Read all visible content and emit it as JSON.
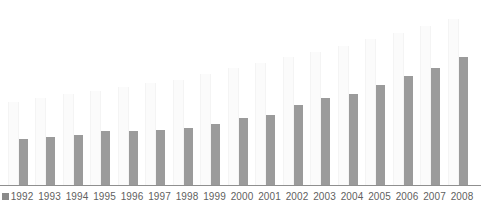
{
  "chart_data": {
    "type": "bar",
    "title": "",
    "subtitle": "",
    "xlabel": "",
    "ylabel": "",
    "grid": false,
    "legend_position": "bottom-left",
    "axis_baseline_visible": true,
    "ylim": [
      0,
      100
    ],
    "categories": [
      "1992",
      "1993",
      "1994",
      "1995",
      "1996",
      "1997",
      "1998",
      "1999",
      "2000",
      "2001",
      "2002",
      "2003",
      "2004",
      "2005",
      "2006",
      "2007",
      "2008"
    ],
    "series": [
      {
        "name": "series-light",
        "color": "#fbfbfb",
        "values": [
          45,
          47,
          49,
          51,
          53,
          55,
          57,
          60,
          63,
          66,
          69,
          72,
          75,
          79,
          82,
          86,
          90
        ]
      },
      {
        "name": "series-dark",
        "color": "#9b9b9b",
        "values": [
          25,
          26,
          27,
          29,
          29,
          30,
          31,
          33,
          36,
          38,
          43,
          47,
          49,
          54,
          59,
          63,
          69
        ]
      }
    ]
  },
  "legend": {
    "marker_name": "legend-swatch",
    "marker_color": "#8a8a8a",
    "label": ""
  },
  "axis": {
    "tick_labels": [
      "1992",
      "1993",
      "1994",
      "1995",
      "1996",
      "1997",
      "1998",
      "1999",
      "2000",
      "2001",
      "2002",
      "2003",
      "2004",
      "2005",
      "2006",
      "2007",
      "2008"
    ]
  },
  "layout": {
    "plot_left": 0,
    "plot_right": 481,
    "baseline_y": 185,
    "group_width": 27.5,
    "first_group_center": 22,
    "light_bar_width": 9,
    "dark_bar_width": 9,
    "light_bar_offset": -10,
    "dark_bar_offset": 1
  }
}
